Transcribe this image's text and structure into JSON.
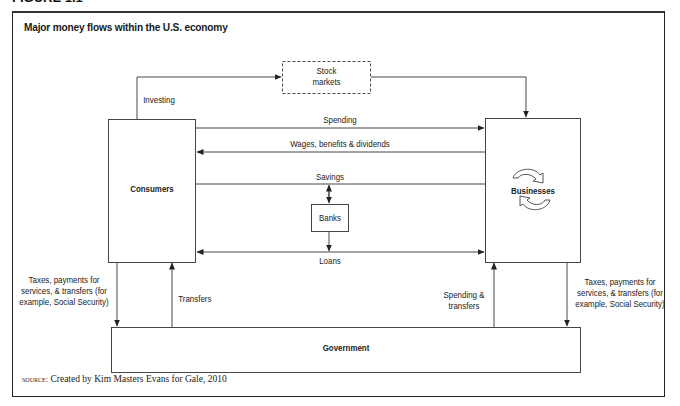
{
  "figure": {
    "label": "FIGURE 1.1",
    "title": "Major money flows within the U.S. economy",
    "source_prefix": "source:",
    "source_text": "Created by Kim Masters Evans for Gale, 2010"
  },
  "nodes": {
    "consumers": "Consumers",
    "businesses": "Businesses",
    "government": "Government",
    "banks": "Banks",
    "stock_markets_line1": "Stock",
    "stock_markets_line2": "markets"
  },
  "flows": {
    "investing": "Investing",
    "spending": "Spending",
    "wages": "Wages, benefits & dividends",
    "savings": "Savings",
    "loans": "Loans",
    "transfers": "Transfers",
    "spending_transfers_line1": "Spending &",
    "spending_transfers_line2": "transfers",
    "taxes_left_line1": "Taxes, payments for",
    "taxes_left_line2": "services, & transfers (for",
    "taxes_left_line3": "example, Social Security)",
    "taxes_right_line1": "Taxes, payments for",
    "taxes_right_line2": "services, & transfers (for",
    "taxes_right_line3": "example, Social Security)"
  },
  "colors": {
    "line": "#333333",
    "frame": "#222222",
    "background": "#ffffff"
  }
}
